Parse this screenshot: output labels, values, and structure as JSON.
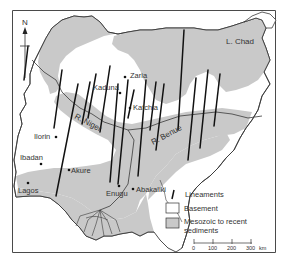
{
  "figure": {
    "colors": {
      "background": "#ffffff",
      "frame": "#4a4a4a",
      "basement": "#ffffff",
      "sediments": "#c9c9c9",
      "border": "#3a3a3a",
      "lineament": "#111111",
      "text": "#333333"
    },
    "north_arrow": {
      "label": "N"
    },
    "lake": {
      "label": "L. Chad"
    },
    "rivers": [
      {
        "id": "niger",
        "label": "R. Niger"
      },
      {
        "id": "benue",
        "label": "R. Benue"
      }
    ],
    "cities": [
      {
        "name": "Zaria"
      },
      {
        "name": "Kaduna"
      },
      {
        "name": "Katchia"
      },
      {
        "name": "Ilorin"
      },
      {
        "name": "Ibadan"
      },
      {
        "name": "Akure"
      },
      {
        "name": "Lagos"
      },
      {
        "name": "Enugu"
      },
      {
        "name": "Abakaliki"
      }
    ],
    "legend": {
      "items": [
        {
          "key": "lineaments",
          "label": "Lineaments"
        },
        {
          "key": "basement",
          "label": "Basement"
        },
        {
          "key": "sediments",
          "label_line1": "Mesozoic to recent",
          "label_line2": "sediments"
        }
      ]
    },
    "scale_bar": {
      "ticks": [
        "0",
        "100",
        "200",
        "300"
      ],
      "unit": "km"
    }
  }
}
